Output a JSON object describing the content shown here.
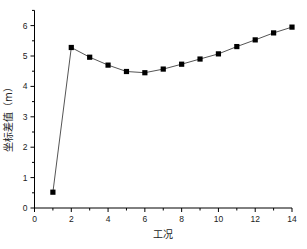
{
  "chart_data": {
    "type": "line",
    "title": "",
    "xlabel": "工况",
    "ylabel": "坐标差值（m）",
    "xlim": [
      0,
      14
    ],
    "ylim": [
      0,
      6.5
    ],
    "x_ticks": [
      0,
      2,
      4,
      6,
      8,
      10,
      12,
      14
    ],
    "y_ticks": [
      0,
      1,
      2,
      3,
      4,
      5,
      6
    ],
    "grid": false,
    "legend": null,
    "series": [
      {
        "name": "坐标差值",
        "marker": "square",
        "color": "#000000",
        "line_color": "#555555",
        "x": [
          1,
          2,
          3,
          4,
          5,
          6,
          7,
          8,
          9,
          10,
          11,
          12,
          13,
          14
        ],
        "values": [
          0.52,
          5.28,
          4.96,
          4.7,
          4.49,
          4.45,
          4.57,
          4.73,
          4.9,
          5.07,
          5.31,
          5.53,
          5.76,
          5.95
        ]
      }
    ]
  }
}
